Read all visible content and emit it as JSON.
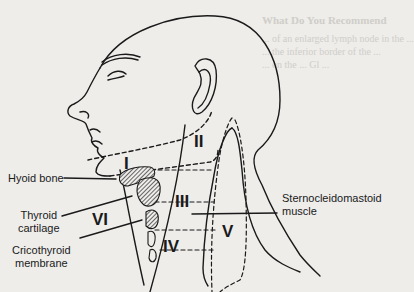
{
  "figure": {
    "background_bleedthrough": {
      "heading": "What Do You Recommend",
      "lines": [
        "... of an enlarged lymph node in the ...",
        "... the inferior border of the ...",
        "... on the ... Gl ..."
      ]
    },
    "levels": [
      {
        "id": "I",
        "label": "I"
      },
      {
        "id": "II",
        "label": "II"
      },
      {
        "id": "III",
        "label": "III"
      },
      {
        "id": "IV",
        "label": "IV"
      },
      {
        "id": "V",
        "label": "V"
      },
      {
        "id": "VI",
        "label": "VI"
      }
    ],
    "labels": {
      "hyoid": "Hyoid bone",
      "thyroid_1": "Thyroid",
      "thyroid_2": "cartilage",
      "cricothyroid_1": "Cricothyroid",
      "cricothyroid_2": "membrane",
      "scm_1": "Sternocleidomastoid",
      "scm_2": "muscle"
    },
    "colors": {
      "ink": "#1a1a1a",
      "paper": "#eeedea",
      "bleed": "#c9c7c2"
    }
  }
}
